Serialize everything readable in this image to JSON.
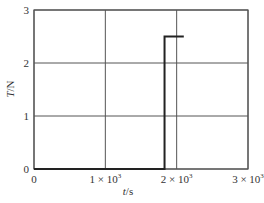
{
  "chart_data": {
    "type": "line",
    "title": "",
    "xlabel": "t/s",
    "ylabel": "T/N",
    "xlim": [
      0,
      3000
    ],
    "ylim": [
      0,
      3
    ],
    "grid": true,
    "x_ticks": [
      0,
      1000,
      2000,
      3000
    ],
    "x_tick_labels": [
      "0",
      "1 × 10³",
      "2 × 10³",
      "3 × 10³"
    ],
    "y_ticks": [
      0,
      1,
      2,
      3
    ],
    "y_tick_labels": [
      "0",
      "1",
      "2",
      "3"
    ],
    "series": [
      {
        "name": "T(t)",
        "x": [
          0,
          1830,
          1830,
          2100
        ],
        "y": [
          0,
          0,
          2.5,
          2.5
        ]
      }
    ],
    "legend": null
  },
  "labels": {
    "xlabel_italic": "t",
    "xlabel_unit": "/s",
    "ylabel_italic": "T",
    "ylabel_unit": "/N"
  }
}
